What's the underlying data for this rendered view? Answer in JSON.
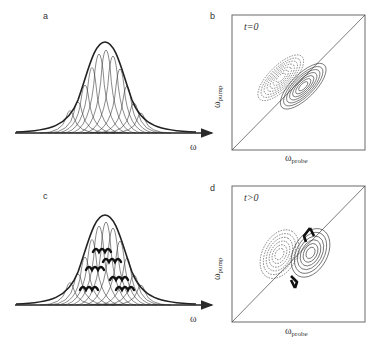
{
  "header": {
    "text": ""
  },
  "panels": {
    "a": {
      "label": "a",
      "xaxis": "ω"
    },
    "b": {
      "label": "b",
      "time": "t=0",
      "xaxis_main": "ω",
      "xaxis_sub": "probe",
      "yaxis_main": "ω",
      "yaxis_sub": "pump"
    },
    "c": {
      "label": "c",
      "xaxis": "ω"
    },
    "d": {
      "label": "d",
      "time": "t>0",
      "xaxis_main": "ω",
      "xaxis_sub": "probe",
      "yaxis_main": "ω",
      "yaxis_sub": "pump"
    }
  },
  "colors": {
    "line": "#2a2a2a",
    "frame": "#6a6a6a",
    "background": "#ffffff"
  }
}
